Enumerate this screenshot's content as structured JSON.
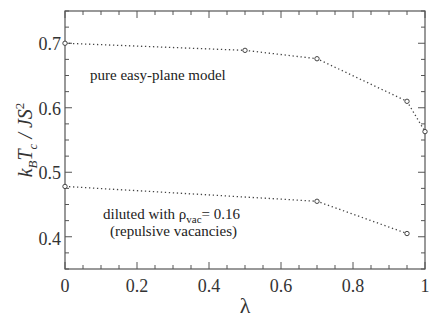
{
  "chart_data": {
    "type": "line",
    "title": "",
    "xlabel": "λ",
    "ylabel": "k_B T_c / JS^2",
    "xlim": [
      0,
      1
    ],
    "ylim": [
      0.35,
      0.75
    ],
    "xticks": [
      "0",
      "0.2",
      "0.4",
      "0.6",
      "0.8",
      "1"
    ],
    "yticks": [
      "0.4",
      "0.5",
      "0.6",
      "0.7"
    ],
    "grid": false,
    "legend": "none (inline annotations)",
    "series": [
      {
        "name": "pure easy-plane model",
        "x": [
          0,
          0.5,
          0.7,
          0.95,
          1.0
        ],
        "y": [
          0.7,
          0.689,
          0.676,
          0.61,
          0.563
        ],
        "style": "dotted line, open circle markers"
      },
      {
        "name": "diluted with ρvac = 0.16 (repulsive vacancies)",
        "x": [
          0,
          0.7,
          0.95
        ],
        "y": [
          0.478,
          0.455,
          0.405
        ],
        "style": "dotted line, open circle markers"
      }
    ],
    "annotations": [
      "pure easy-plane model",
      "diluted with ρvac = 0.16",
      "(repulsive vacancies)"
    ]
  },
  "labels": {
    "x0": "0",
    "x1": "0.2",
    "x2": "0.4",
    "x3": "0.6",
    "x4": "0.8",
    "x5": "1",
    "y1": "0.4",
    "y2": "0.5",
    "y3": "0.6",
    "y4": "0.7",
    "xlabel": "λ",
    "ylabel_k": "k",
    "ylabel_B": "B",
    "ylabel_T": "T",
    "ylabel_c": "c",
    "ylabel_rest": " / JS",
    "ylabel_sup": "2",
    "annot1": "pure easy-plane model",
    "annot2a": "diluted with ρ",
    "annot2sub": "vac",
    "annot2b": "= 0.16",
    "annot3": "(repulsive vacancies)"
  }
}
